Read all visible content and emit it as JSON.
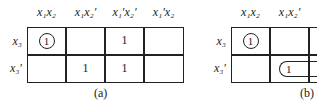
{
  "map_a": {
    "columns": [
      "x₁x₂",
      "x₁x₂′",
      "x₁′x₂′",
      "x₁′x₂"
    ],
    "rows": [
      "x₃",
      "x₃′"
    ],
    "cells": [
      [
        "1",
        "",
        "1",
        ""
      ],
      [
        "",
        "1",
        "1",
        ""
      ]
    ],
    "circled": [
      [
        0,
        0
      ]
    ],
    "caption": "(a)"
  },
  "map_b": {
    "columns": [
      "x₁x₂",
      "x₁x₂′"
    ],
    "rows": [
      "x₃",
      "x₃′"
    ],
    "cells": [
      [
        "1",
        ""
      ],
      [
        "",
        "1"
      ]
    ],
    "circled": [
      [
        0,
        0
      ]
    ],
    "looped": [
      [
        1,
        1
      ]
    ],
    "caption": "(b)"
  }
}
